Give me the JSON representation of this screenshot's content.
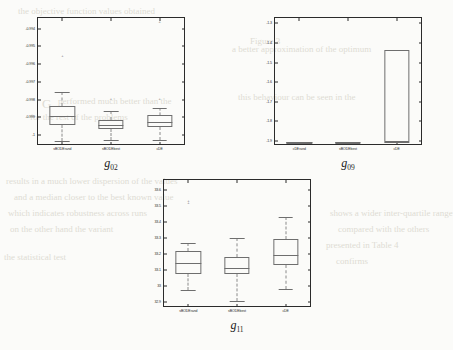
{
  "background": {
    "paper_color": "#fbfbf9",
    "bleed_color": "#dedbd4",
    "bleed_lines": [
      {
        "text": "the  objective  function  values  obtained",
        "x": 18,
        "y": 6,
        "size": 9
      },
      {
        "text": "G",
        "x": 42,
        "y": 96,
        "size": 13
      },
      {
        "text": "performed  much  better  than  the",
        "x": 58,
        "y": 96,
        "size": 9
      },
      {
        "text": "for  the  rest  of  the  problems",
        "x": 30,
        "y": 112,
        "size": 9
      },
      {
        "text": "a  better  approximation  of  the  optimum",
        "x": 232,
        "y": 44,
        "size": 9
      },
      {
        "text": "this  behaviour  can  be  seen  in  the",
        "x": 238,
        "y": 92,
        "size": 9
      },
      {
        "text": "Figure  3",
        "x": 250,
        "y": 36,
        "size": 9
      },
      {
        "text": "results  in  a  much  lower  dispersion  of  the  values",
        "x": 6,
        "y": 176,
        "size": 9
      },
      {
        "text": "and  a  median  closer  to  the  best  known  value",
        "x": 14,
        "y": 192,
        "size": 9
      },
      {
        "text": "which  indicates  robustness  across  runs",
        "x": 8,
        "y": 208,
        "size": 9
      },
      {
        "text": "on  the  other  hand  the  variant",
        "x": 10,
        "y": 224,
        "size": 9
      },
      {
        "text": "shows  a  wider  inter-quartile  range",
        "x": 330,
        "y": 208,
        "size": 9
      },
      {
        "text": "compared  with  the  others",
        "x": 338,
        "y": 224,
        "size": 9
      },
      {
        "text": "presented  in  Table  4",
        "x": 326,
        "y": 240,
        "size": 9
      },
      {
        "text": "the  statistical  test",
        "x": 4,
        "y": 252,
        "size": 9
      },
      {
        "text": "confirms",
        "x": 336,
        "y": 256,
        "size": 9
      }
    ]
  },
  "figures": [
    {
      "id": "g02",
      "caption_base": "g",
      "caption_sub": "02",
      "chart_data": {
        "type": "box",
        "title": "g02",
        "xlabel": "",
        "ylabel": "",
        "ylim": [
          -1.0005,
          -0.9934
        ],
        "yticks": [
          "-0.994",
          "-0.995",
          "-0.996",
          "-0.997",
          "-0.998",
          "-0.999",
          "-1"
        ],
        "ytick_values": [
          -0.994,
          -0.995,
          -0.996,
          -0.997,
          -0.998,
          -0.999,
          -1.0
        ],
        "categories": [
          "sBODErand",
          "sBODEbest",
          "cDE"
        ],
        "boxes": [
          {
            "name": "sBODErand",
            "whisker_low": -1.00035,
            "q1": -0.99945,
            "median": -0.99895,
            "q3": -0.99835,
            "whisker_high": -0.99757,
            "outliers": [
              -0.99555
            ]
          },
          {
            "name": "sBODEbest",
            "whisker_low": -1.00025,
            "q1": -0.99965,
            "median": -0.99945,
            "q3": -0.99915,
            "whisker_high": -0.99865,
            "outliers": [
              -0.99795
            ]
          },
          {
            "name": "cDE",
            "whisker_low": -1.00025,
            "q1": -0.99955,
            "median": -0.99925,
            "q3": -0.99885,
            "whisker_high": -0.99845,
            "outliers": [
              -0.99795,
              -0.99365
            ]
          }
        ]
      }
    },
    {
      "id": "g09",
      "caption_base": "g",
      "caption_sub": "09",
      "chart_data": {
        "type": "box",
        "title": "g09",
        "xlabel": "",
        "ylabel": "",
        "ylim": [
          -1.915,
          -1.272
        ],
        "yticks": [
          "-1.3",
          "-1.4",
          "-1.5",
          "-1.6",
          "-1.7",
          "-1.8",
          "-1.9"
        ],
        "ytick_values": [
          -1.3,
          -1.4,
          -1.5,
          -1.6,
          -1.7,
          -1.8,
          -1.9
        ],
        "categories": [
          "cDErand",
          "sBODEbest",
          "cDE"
        ],
        "boxes": [
          {
            "name": "cDErand",
            "whisker_low": -1.9055,
            "q1": -1.9045,
            "median": -1.904,
            "q3": -1.9035,
            "whisker_high": -1.9025,
            "outliers": []
          },
          {
            "name": "sBODEbest",
            "whisker_low": -1.9055,
            "q1": -1.9045,
            "median": -1.904,
            "q3": -1.9035,
            "whisker_high": -1.9025,
            "outliers": []
          },
          {
            "name": "cDE",
            "whisker_low": -1.905,
            "q1": -1.903,
            "median": -1.903,
            "q3": -1.4375,
            "whisker_high": -1.4375,
            "outliers": []
          }
        ]
      }
    },
    {
      "id": "g11",
      "caption_base": "g",
      "caption_sub": "11",
      "chart_data": {
        "type": "box",
        "title": "g11",
        "xlabel": "",
        "ylabel": "",
        "ylim": [
          32.875,
          33.665
        ],
        "yticks": [
          "33.6",
          "33.5",
          "33.4",
          "33.3",
          "33.2",
          "33.1",
          "33",
          "32.9"
        ],
        "ytick_values": [
          33.6,
          33.5,
          33.4,
          33.3,
          33.2,
          33.1,
          33.0,
          32.9
        ],
        "categories": [
          "sBODErand",
          "sBODEbest",
          "cDE"
        ],
        "boxes": [
          {
            "name": "sBODErand",
            "whisker_low": 32.975,
            "q1": 33.077,
            "median": 33.143,
            "q3": 33.222,
            "whisker_high": 33.272,
            "outliers": [
              33.523,
              33.535
            ]
          },
          {
            "name": "sBODEbest",
            "whisker_low": 32.905,
            "q1": 33.073,
            "median": 33.112,
            "q3": 33.182,
            "whisker_high": 33.303,
            "outliers": []
          },
          {
            "name": "cDE",
            "whisker_low": 32.982,
            "q1": 33.133,
            "median": 33.192,
            "q3": 33.297,
            "whisker_high": 33.432,
            "outliers": []
          }
        ]
      }
    }
  ]
}
